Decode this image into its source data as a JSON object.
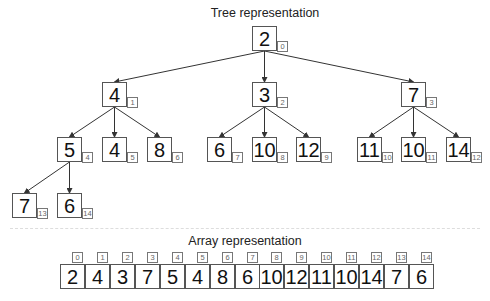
{
  "tree": {
    "title": "Tree representation",
    "nodes": [
      {
        "value": "2",
        "index": "0",
        "x": 252,
        "y": 26
      },
      {
        "value": "4",
        "index": "1",
        "x": 102,
        "y": 82
      },
      {
        "value": "3",
        "index": "2",
        "x": 252,
        "y": 82
      },
      {
        "value": "7",
        "index": "3",
        "x": 401,
        "y": 82
      },
      {
        "value": "5",
        "index": "4",
        "x": 57,
        "y": 137
      },
      {
        "value": "4",
        "index": "5",
        "x": 102,
        "y": 137
      },
      {
        "value": "8",
        "index": "6",
        "x": 147,
        "y": 137
      },
      {
        "value": "6",
        "index": "7",
        "x": 207,
        "y": 137
      },
      {
        "value": "10",
        "index": "8",
        "x": 252,
        "y": 137
      },
      {
        "value": "12",
        "index": "9",
        "x": 296,
        "y": 137
      },
      {
        "value": "11",
        "index": "10",
        "x": 357,
        "y": 137
      },
      {
        "value": "10",
        "index": "11",
        "x": 401,
        "y": 137
      },
      {
        "value": "14",
        "index": "12",
        "x": 446,
        "y": 137
      },
      {
        "value": "7",
        "index": "13",
        "x": 12,
        "y": 193
      },
      {
        "value": "6",
        "index": "14",
        "x": 57,
        "y": 193
      }
    ],
    "edges": [
      [
        0,
        1
      ],
      [
        0,
        2
      ],
      [
        0,
        3
      ],
      [
        1,
        4
      ],
      [
        1,
        5
      ],
      [
        1,
        6
      ],
      [
        2,
        7
      ],
      [
        2,
        8
      ],
      [
        2,
        9
      ],
      [
        3,
        10
      ],
      [
        3,
        11
      ],
      [
        3,
        12
      ],
      [
        4,
        13
      ],
      [
        4,
        14
      ]
    ]
  },
  "array": {
    "title": "Array representation",
    "cells": [
      {
        "value": "2",
        "index": "0"
      },
      {
        "value": "4",
        "index": "1"
      },
      {
        "value": "3",
        "index": "2"
      },
      {
        "value": "7",
        "index": "3"
      },
      {
        "value": "5",
        "index": "4"
      },
      {
        "value": "4",
        "index": "5"
      },
      {
        "value": "8",
        "index": "6"
      },
      {
        "value": "6",
        "index": "7"
      },
      {
        "value": "10",
        "index": "8"
      },
      {
        "value": "12",
        "index": "9"
      },
      {
        "value": "11",
        "index": "10"
      },
      {
        "value": "10",
        "index": "11"
      },
      {
        "value": "14",
        "index": "12"
      },
      {
        "value": "7",
        "index": "13"
      },
      {
        "value": "6",
        "index": "14"
      }
    ]
  }
}
